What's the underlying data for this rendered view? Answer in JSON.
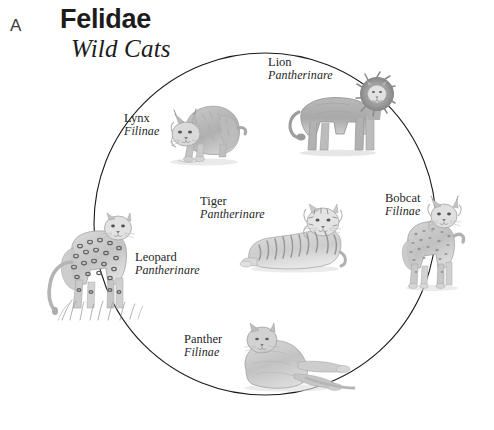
{
  "figure": {
    "panel_letter": "A",
    "title": "Felidae",
    "subtitle": "Wild Cats",
    "layout": "circular-cladogram",
    "background_color": "#ffffff",
    "line_color": "#1a1a1a"
  },
  "circle": {
    "center_x": 265,
    "center_y": 224,
    "radius": 171,
    "stroke_width": 1.1
  },
  "species": [
    {
      "id": "lion",
      "common_name": "Lion",
      "subfamily": "Pantherinare",
      "label_x": 268,
      "label_y": 56,
      "align": "left"
    },
    {
      "id": "lynx",
      "common_name": "Lynx",
      "subfamily": "Filinae",
      "label_x": 124,
      "label_y": 112,
      "align": "left"
    },
    {
      "id": "tiger",
      "common_name": "Tiger",
      "subfamily": "Pantherinare",
      "label_x": 200,
      "label_y": 195,
      "align": "left"
    },
    {
      "id": "bobcat",
      "common_name": "Bobcat",
      "subfamily": "Filinae",
      "label_x": 385,
      "label_y": 192,
      "align": "left"
    },
    {
      "id": "leopard",
      "common_name": "Leopard",
      "subfamily": "Pantherinare",
      "label_x": 135,
      "label_y": 251,
      "align": "left"
    },
    {
      "id": "panther",
      "common_name": "Panther",
      "subfamily": "Filinae",
      "label_x": 184,
      "label_y": 333,
      "align": "left"
    }
  ]
}
